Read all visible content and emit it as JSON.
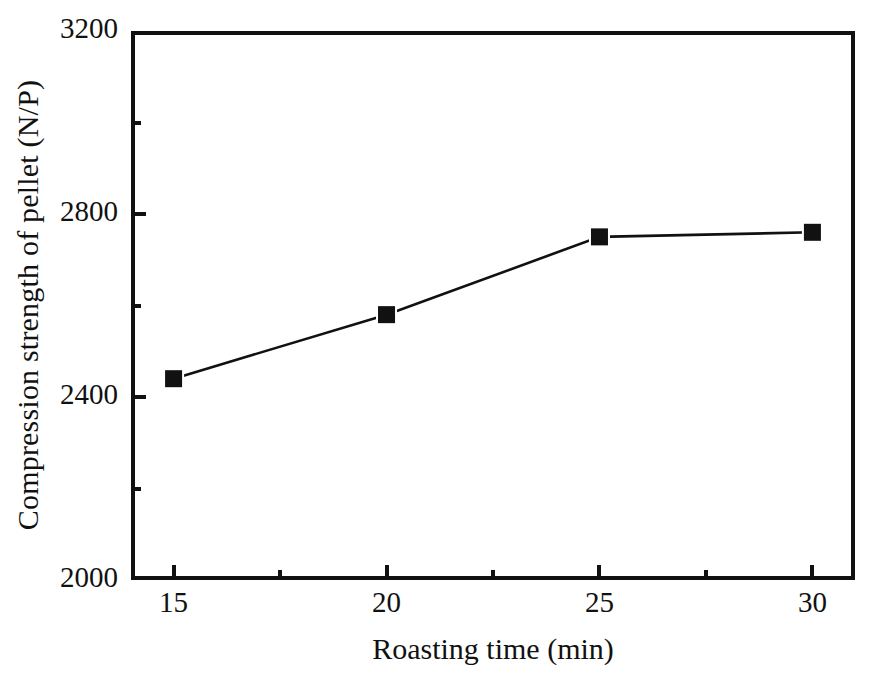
{
  "chart_data": {
    "type": "line",
    "title": "",
    "xlabel": "Roasting time (min)",
    "ylabel": "Compression strength of pellet (N/P)",
    "x": [
      15,
      20,
      25,
      30
    ],
    "values": [
      2440,
      2580,
      2750,
      2760
    ],
    "series": [
      {
        "name": "Compression strength of pellet",
        "x": [
          15,
          20,
          25,
          30
        ],
        "values": [
          2440,
          2580,
          2750,
          2760
        ],
        "marker": "filled-square",
        "marker_color": "#111111",
        "line_color": "#111111"
      }
    ],
    "xlim": [
      14,
      31
    ],
    "ylim": [
      2000,
      3200
    ],
    "x_ticks_major": [
      15,
      20,
      25,
      30
    ],
    "x_ticks_minor": [
      17.5,
      22.5,
      27.5
    ],
    "y_ticks_major": [
      2000,
      2400,
      2800,
      3200
    ],
    "y_ticks_minor": [
      2200,
      2600,
      3000
    ],
    "x_tick_labels": [
      "15",
      "20",
      "25",
      "30"
    ],
    "y_tick_labels": [
      "2000",
      "2400",
      "2800",
      "3200"
    ],
    "grid": false,
    "legend": false,
    "legend_position": "none",
    "frame": "box"
  },
  "axis": {
    "x_title": "Roasting time (min)",
    "y_title": "Compression strength of pellet (N/P)"
  },
  "colors": {
    "line": "#111111",
    "marker": "#111111",
    "frame": "#111111",
    "background": "#ffffff"
  }
}
